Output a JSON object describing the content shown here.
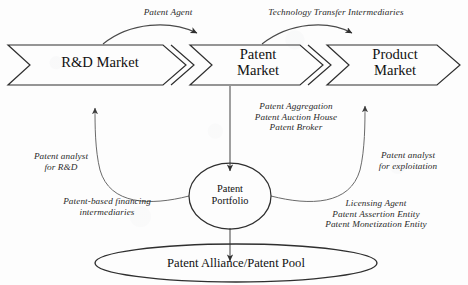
{
  "diagram": {
    "stroke_color": "#2f2f2f",
    "text_color": "#1a1a1a",
    "background_color": "#fdfdfd"
  },
  "stages": [
    {
      "id": "rd-market",
      "label": "R&D Market"
    },
    {
      "id": "patent-market",
      "label": "Patent\nMarket"
    },
    {
      "id": "product-market",
      "label": "Product\nMarket"
    }
  ],
  "top_arrow_labels": [
    {
      "id": "patent-agent",
      "label": "Patent Agent"
    },
    {
      "id": "technology-transfer-intermediaries",
      "label": "Technology Transfer Intermediaries"
    }
  ],
  "center_node": {
    "id": "patent-portfolio",
    "label": "Patent\nPortfolio"
  },
  "bottom_node": {
    "id": "patent-alliance-patent-pool",
    "label": "Patent Alliance/Patent Pool"
  },
  "annotations": [
    {
      "id": "patent-aggregation-group",
      "label": "Patent Aggregation\nPatent Auction House\nPatent Broker"
    },
    {
      "id": "patent-analyst-rd",
      "label": "Patent analyst\nfor R&D"
    },
    {
      "id": "patent-based-financing",
      "label": "Patent-based financing\nintermediaries"
    },
    {
      "id": "patent-analyst-exploitation",
      "label": "Patent analyst\nfor exploitation"
    },
    {
      "id": "licensing-agent-group",
      "label": "Licensing Agent\nPatent Assertion Entity\nPatent Monetization Entity"
    }
  ]
}
